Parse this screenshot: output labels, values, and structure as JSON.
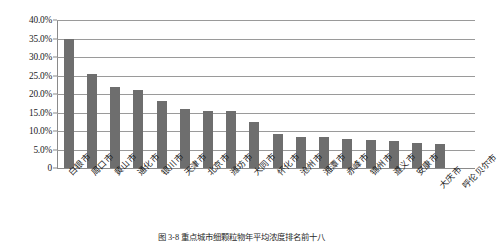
{
  "chart_data": {
    "type": "bar",
    "title": "",
    "xlabel": "",
    "ylabel": "",
    "ylim": [
      0,
      40
    ],
    "grid": true,
    "legend": "none",
    "bar_color": "#6e6e6e",
    "ytick_labels": [
      "40.0%",
      "35.0%",
      "30.0%",
      "25.0%",
      "20.0%",
      "15.0%",
      "10.0%",
      "5.0%",
      "0"
    ],
    "ytick_values": [
      40,
      35,
      30,
      25,
      20,
      15,
      10,
      5,
      0
    ],
    "categories": [
      "白银市",
      "周口市",
      "黄山市",
      "通化市",
      "银川市",
      "天津市",
      "北京市",
      "潍坊市",
      "大同市",
      "怀化市",
      "沧州市",
      "湘潭市",
      "赤峰市",
      "锦州市",
      "遵义市",
      "安康市",
      "大庆市",
      "呼伦贝尔市"
    ],
    "values": [
      34.8,
      25.5,
      21.8,
      21.0,
      18.0,
      16.0,
      15.5,
      15.3,
      12.5,
      9.3,
      8.5,
      8.3,
      7.8,
      7.5,
      7.3,
      6.8,
      6.5,
      null
    ],
    "value_unit": "%",
    "dropped_labels": [
      "大庆市",
      "呼伦贝尔市"
    ]
  },
  "caption": {
    "text": "图 3-8  重点城市细颗粒物年平均浓度排名前十八"
  }
}
